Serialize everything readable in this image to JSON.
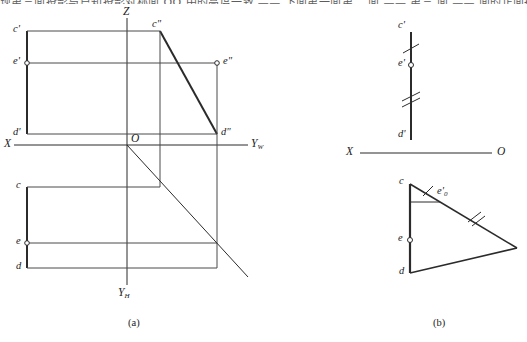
{
  "page": {
    "clipped_header_text": "现第三面投影与已知投影对称面 OO 中的高度一致 —— 下面第一面第二 面 —— 第三 面 —— 面的正面投影",
    "width": 527,
    "height": 342,
    "background": "#ffffff",
    "line_color": "#2b2b2b",
    "thin_line_color": "#4a4a4a"
  },
  "figures": [
    {
      "id": "fig-a",
      "caption": "(a)",
      "description": "Three-view orthographic projection with X, Z, Yw, Yh axes, origin O, mitre line",
      "axes": {
        "x_label": "X",
        "z_label": "Z",
        "yw_label": "Y",
        "yw_sub": "W",
        "yh_label": "Y",
        "yh_sub": "H",
        "origin_label": "O"
      },
      "points": [
        {
          "name": "c-prime",
          "label": "c",
          "prime": "'",
          "marker": "none"
        },
        {
          "name": "e-prime",
          "label": "e",
          "prime": "'",
          "marker": "circle"
        },
        {
          "name": "d-prime",
          "label": "d",
          "prime": "'",
          "marker": "none"
        },
        {
          "name": "c-double",
          "label": "c",
          "prime": "\"",
          "marker": "none"
        },
        {
          "name": "e-double",
          "label": "e",
          "prime": "\"",
          "marker": "circle"
        },
        {
          "name": "d-double",
          "label": "d",
          "prime": "\"",
          "marker": "none"
        },
        {
          "name": "c-plan",
          "label": "c",
          "prime": "",
          "marker": "none"
        },
        {
          "name": "e-plan",
          "label": "e",
          "prime": "",
          "marker": "circle"
        },
        {
          "name": "d-plan",
          "label": "d",
          "prime": "",
          "marker": "none"
        }
      ]
    },
    {
      "id": "fig-b",
      "caption": "(b)",
      "description": "True-length construction: vertical segment with tick marks and a triangle",
      "axes": {
        "x_label": "X",
        "origin_label": "O"
      },
      "points": [
        {
          "name": "c-prime",
          "label": "c",
          "prime": "'",
          "marker": "none"
        },
        {
          "name": "e-prime",
          "label": "e",
          "prime": "'",
          "marker": "circle"
        },
        {
          "name": "d-prime",
          "label": "d",
          "prime": "'",
          "marker": "none"
        },
        {
          "name": "c-plan",
          "label": "c",
          "prime": "",
          "marker": "none"
        },
        {
          "name": "d-plan",
          "label": "d",
          "prime": "",
          "marker": "none"
        },
        {
          "name": "e-plan",
          "label": "e",
          "prime": "",
          "marker": "circle"
        },
        {
          "name": "e0-prime",
          "label": "e",
          "prime": "'",
          "sub": "0",
          "marker": "none"
        }
      ],
      "tick_marks": {
        "single_upper": 1,
        "double_lower": 2,
        "single_triangle_top": 1,
        "double_triangle_hyp": 2
      }
    }
  ]
}
